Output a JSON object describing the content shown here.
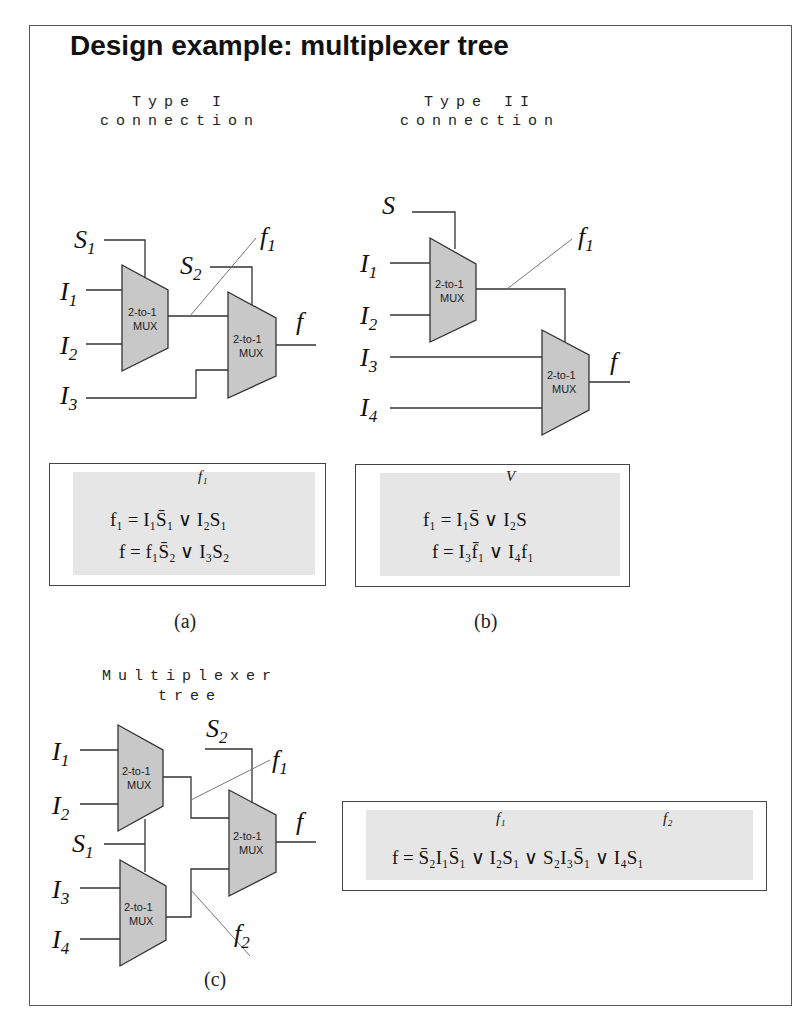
{
  "title": "Design example: multiplexer tree",
  "sections": {
    "type1": {
      "heading_line1": "Type I",
      "heading_line2": "connection",
      "inputs": [
        "S",
        "I",
        "I",
        "I",
        "S"
      ],
      "labels": {
        "s1": "S",
        "s1_sub": "1",
        "i1": "I",
        "i1_sub": "1",
        "i2": "I",
        "i2_sub": "2",
        "i3": "I",
        "i3_sub": "3",
        "s2": "S",
        "s2_sub": "2",
        "f1": "f",
        "f1_sub": "1",
        "f": "f"
      },
      "mux_label_line1": "2-to-1",
      "mux_label_line2": "MUX",
      "equations": {
        "brace_label": "f₁",
        "line1": "f₁ = I₁S̄₁ ∨ I₂S₁",
        "line2": "f = f₁S̄₂ ∨ I₃S₂"
      },
      "caption": "(a)"
    },
    "type2": {
      "heading_line1": "Type II",
      "heading_line2": "connection",
      "labels": {
        "s": "S",
        "i1": "I",
        "i1_sub": "1",
        "i2": "I",
        "i2_sub": "2",
        "i3": "I",
        "i3_sub": "3",
        "i4": "I",
        "i4_sub": "4",
        "f1": "f",
        "f1_sub": "1",
        "f": "f"
      },
      "mux_label_line1": "2-to-1",
      "mux_label_line2": "MUX",
      "equations": {
        "brace_label": "V",
        "line1": "f₁ = I₁S̄ ∨ I₂S",
        "line2": "f = I₃f̄₁ ∨ I₄f₁"
      },
      "caption": "(b)"
    },
    "tree": {
      "heading_line1": "Multiplexer",
      "heading_line2": "tree",
      "labels": {
        "i1": "I",
        "i1_sub": "1",
        "i2": "I",
        "i2_sub": "2",
        "s1": "S",
        "s1_sub": "1",
        "i3": "I",
        "i3_sub": "3",
        "i4": "I",
        "i4_sub": "4",
        "s2": "S",
        "s2_sub": "2",
        "f1": "f",
        "f1_sub": "1",
        "f2": "f",
        "f2_sub": "2",
        "f": "f"
      },
      "mux_label_line1": "2-to-1",
      "mux_label_line2": "MUX",
      "equations": {
        "brace1_label": "f₁",
        "brace2_label": "f₂",
        "line1": "f = S̄₂I₁S̄₁ ∨ I₂S₁ ∨ S₂I₃S̄₁ ∨ I₄S₁"
      },
      "caption": "(c)"
    }
  },
  "colors": {
    "mux_fill": "#c8c8c8",
    "eq_shade": "#e6e6e6",
    "line": "#333333",
    "thin_line": "#777777"
  }
}
